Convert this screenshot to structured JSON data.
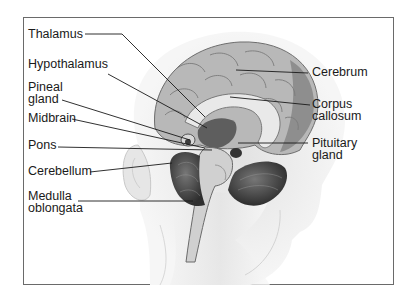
{
  "diagram": {
    "labels_left": [
      {
        "id": "thalamus",
        "text": "Thalamus"
      },
      {
        "id": "hypothalamus",
        "text": "Hypothalamus"
      },
      {
        "id": "pineal-gland",
        "line1": "Pineal",
        "line2": "gland"
      },
      {
        "id": "midbrain",
        "text": "Midbrain"
      },
      {
        "id": "pons",
        "text": "Pons"
      },
      {
        "id": "cerebellum",
        "text": "Cerebellum"
      },
      {
        "id": "medulla-oblongata",
        "line1": "Medulla",
        "line2": "oblongata"
      }
    ],
    "labels_right": [
      {
        "id": "cerebrum",
        "text": "Cerebrum"
      },
      {
        "id": "corpus-callosum",
        "line1": "Corpus",
        "line2": "callosum"
      },
      {
        "id": "pituitary-gland",
        "line1": "Pituitary",
        "line2": "gland"
      }
    ],
    "colors": {
      "border": "#6a6a6a",
      "leader_line": "#1a1a1a",
      "text": "#1a1a1a",
      "brain_light": "#c9c9c9",
      "brain_mid": "#9a9a9a",
      "brain_dark": "#4a4a4a",
      "skin": "#ececec"
    }
  }
}
